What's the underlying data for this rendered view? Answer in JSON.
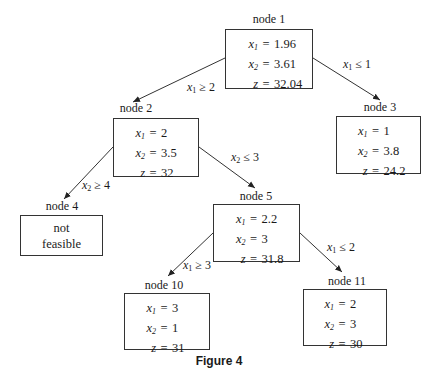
{
  "caption": "Figure 4",
  "nodes": {
    "n1": {
      "label": "node 1",
      "x1": "1.96",
      "x2": "3.61",
      "z": "32.04"
    },
    "n2": {
      "label": "node 2",
      "x1": "2",
      "x2": "3.5",
      "z": "32"
    },
    "n3": {
      "label": "node 3",
      "x1": "1",
      "x2": "3.8",
      "z": "24.2"
    },
    "n4": {
      "label": "node 4",
      "line1": "not",
      "line2": "feasible"
    },
    "n5": {
      "label": "node 5",
      "x1": "2.2",
      "x2": "3",
      "z": "31.8"
    },
    "n10": {
      "label": "node 10",
      "x1": "3",
      "x2": "1",
      "z": "31"
    },
    "n11": {
      "label": "node 11",
      "x1": "2",
      "x2": "3",
      "z": "30"
    }
  },
  "vars": {
    "x": "x",
    "z": "z",
    "sub1": "1",
    "sub2": "2",
    "eq": "="
  },
  "edges": {
    "e12": {
      "var_sub": "1",
      "op": "≥",
      "val": "2"
    },
    "e13": {
      "var_sub": "1",
      "op": "≤",
      "val": "1"
    },
    "e24": {
      "var_sub": "2",
      "op": "≥",
      "val": "4"
    },
    "e25": {
      "var_sub": "2",
      "op": "≤",
      "val": "3"
    },
    "e510": {
      "var_sub": "1",
      "op": "≥",
      "val": "3"
    },
    "e511": {
      "var_sub": "1",
      "op": "≤",
      "val": "2"
    }
  }
}
